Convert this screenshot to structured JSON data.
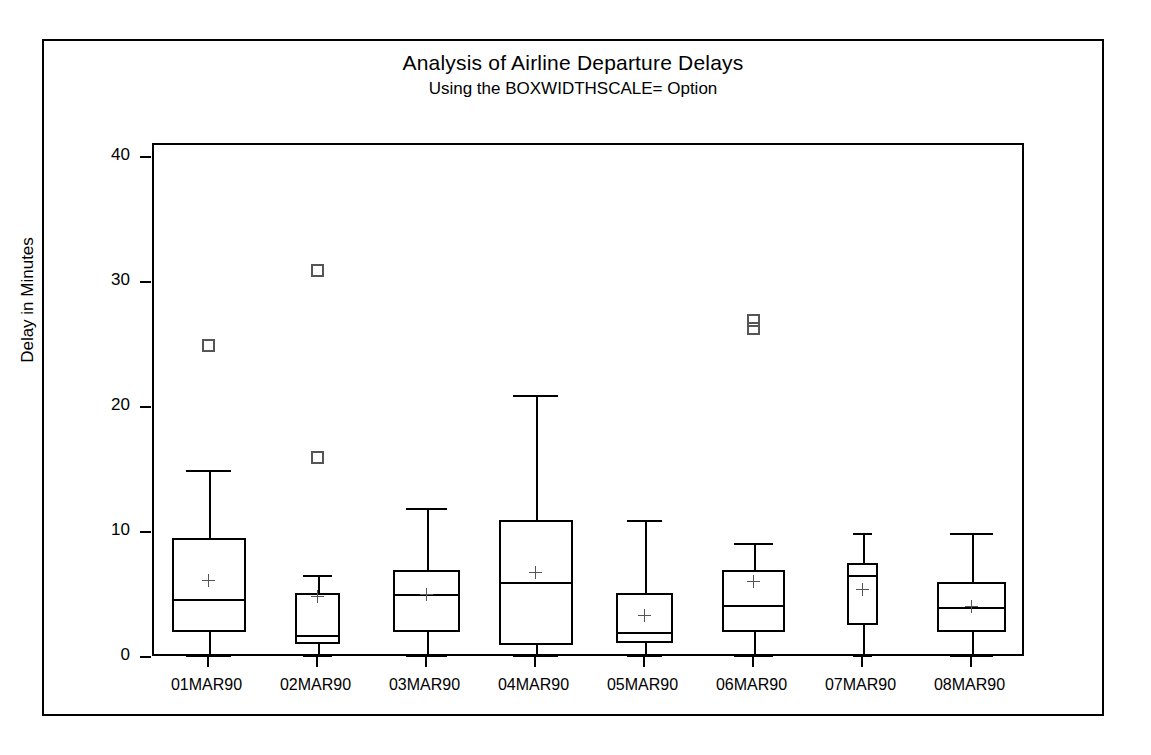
{
  "chart_data": {
    "type": "box",
    "title": "Analysis of Airline Departure Delays",
    "subtitle": "Using the BOXWIDTHSCALE= Option",
    "xlabel": "",
    "ylabel": "Delay in Minutes",
    "ylim": [
      0,
      41
    ],
    "yticks": [
      0,
      10,
      20,
      30,
      40
    ],
    "ytick_labels": [
      "0",
      "10",
      "20",
      "30",
      "40"
    ],
    "grid": false,
    "legend": "none",
    "note": "Box widths are scaled by sample size (BOXWIDTHSCALE= option); squares are outliers, plus signs are means.",
    "categories": [
      "01MAR90",
      "02MAR90",
      "03MAR90",
      "04MAR90",
      "05MAR90",
      "06MAR90",
      "07MAR90",
      "08MAR90"
    ],
    "boxes": [
      {
        "category": "01MAR90",
        "min": 0.2,
        "q1": 2.1,
        "median": 4.7,
        "q3": 9.6,
        "max": 15.0,
        "mean": 6.2,
        "outliers": [
          25.0
        ],
        "width_scale": 1.0
      },
      {
        "category": "02MAR90",
        "min": 0.2,
        "q1": 1.1,
        "median": 1.8,
        "q3": 5.2,
        "max": 6.6,
        "mean": 4.9,
        "outliers": [
          31.0,
          16.0
        ],
        "width_scale": 0.62
      },
      {
        "category": "03MAR90",
        "min": 0.2,
        "q1": 2.1,
        "median": 5.1,
        "q3": 7.0,
        "max": 12.0,
        "mean": 5.1,
        "outliers": [],
        "width_scale": 0.9
      },
      {
        "category": "04MAR90",
        "min": 0.2,
        "q1": 1.0,
        "median": 6.1,
        "q3": 11.0,
        "max": 21.0,
        "mean": 6.8,
        "outliers": [],
        "width_scale": 1.0
      },
      {
        "category": "05MAR90",
        "min": 0.2,
        "q1": 1.2,
        "median": 2.1,
        "q3": 5.2,
        "max": 11.0,
        "mean": 3.4,
        "outliers": [],
        "width_scale": 0.78
      },
      {
        "category": "06MAR90",
        "min": 0.2,
        "q1": 2.1,
        "median": 4.2,
        "q3": 7.0,
        "max": 9.2,
        "mean": 6.1,
        "outliers": [
          27.0,
          26.3
        ],
        "width_scale": 0.86
      },
      {
        "category": "07MAR90",
        "min": 0.2,
        "q1": 2.6,
        "median": 6.6,
        "q3": 7.6,
        "max": 10.0,
        "mean": 5.5,
        "outliers": [],
        "width_scale": 0.42
      },
      {
        "category": "08MAR90",
        "min": 0.2,
        "q1": 2.1,
        "median": 4.1,
        "q3": 6.1,
        "max": 10.0,
        "mean": 4.1,
        "outliers": [],
        "width_scale": 0.92
      }
    ]
  }
}
